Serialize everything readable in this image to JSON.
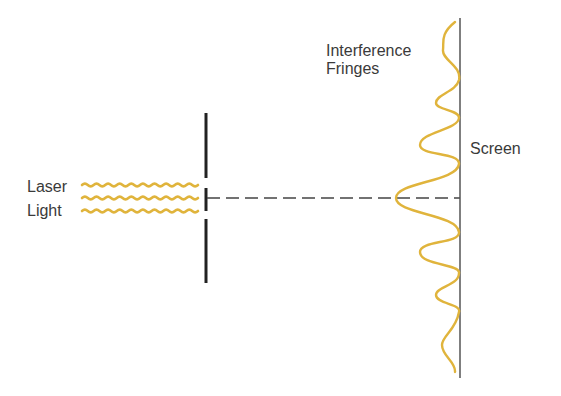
{
  "diagram": {
    "labels": {
      "laser_line1": "Laser",
      "laser_line2": "Light",
      "fringes_line1": "Interference",
      "fringes_line2": "Fringes",
      "screen": "Screen"
    },
    "colors": {
      "wave": "#e0b43c",
      "barrier": "#222222",
      "screen": "#555555",
      "axis_dash": "#444444",
      "text": "#3a3a3a"
    },
    "elements": [
      {
        "name": "laser-light-beams",
        "count": 3
      },
      {
        "name": "slit-barrier",
        "x": 206
      },
      {
        "name": "central-axis",
        "style": "dashed"
      },
      {
        "name": "screen",
        "x": 460
      },
      {
        "name": "interference-pattern",
        "peaks": 7
      }
    ]
  }
}
